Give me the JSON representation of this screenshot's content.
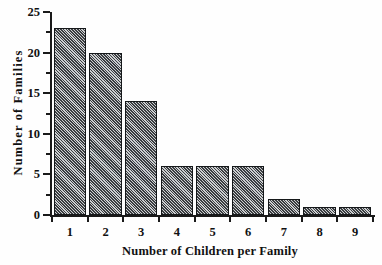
{
  "chart_data": {
    "type": "bar",
    "title": "",
    "xlabel": "Number of Children per Family",
    "ylabel": "Number  of  Families",
    "categories": [
      "1",
      "2",
      "3",
      "4",
      "5",
      "6",
      "7",
      "8",
      "9"
    ],
    "values": [
      23,
      20,
      14,
      6,
      6,
      6,
      2,
      1,
      1
    ],
    "ylim": [
      0,
      25
    ],
    "ytick_labels": [
      "0",
      "5",
      "10",
      "15",
      "20",
      "25"
    ],
    "ytick_values": [
      0,
      5,
      10,
      15,
      20,
      25
    ],
    "yminor_values": [
      2.5,
      7.5,
      12.5,
      17.5,
      22.5
    ],
    "grid": false,
    "legend": false,
    "bar_fill_color": "#3a3d40",
    "bar_edge_color": "#15181a",
    "bar_hatch": "diagonal-lines",
    "axis_color": "#1a1a1a",
    "background_color": "#fefefe"
  }
}
